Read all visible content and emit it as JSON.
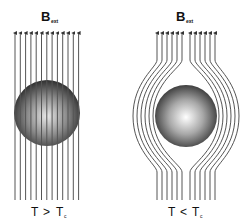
{
  "left_panel": {
    "field_label": "B",
    "field_subscript": "ext",
    "condition_T": "T",
    "condition_op": ">",
    "condition_Tc": "T",
    "condition_sub": "c",
    "line_count": 13,
    "description": "normal state: field lines pass through sphere"
  },
  "right_panel": {
    "field_label": "B",
    "field_subscript": "ext",
    "condition_T": "T",
    "condition_op": "<",
    "condition_Tc": "T",
    "condition_sub": "c",
    "line_count": 12,
    "description": "superconducting state: field lines expelled around sphere"
  },
  "colors": {
    "line": "#555555",
    "sphere_dark": "#2a2a2a",
    "sphere_light": "#f2f2f2"
  }
}
